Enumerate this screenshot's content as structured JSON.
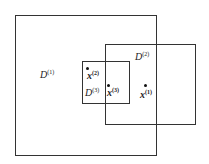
{
  "regions": [
    {
      "name": "D",
      "sup": "(1)"
    },
    {
      "name": "D",
      "sup": "(2)"
    },
    {
      "name": "D",
      "sup": "(3)"
    }
  ],
  "points": [
    {
      "name": "x",
      "sup": "(2)"
    },
    {
      "name": "x",
      "sup": "(3)"
    },
    {
      "name": "x",
      "sup": "(1)"
    }
  ]
}
